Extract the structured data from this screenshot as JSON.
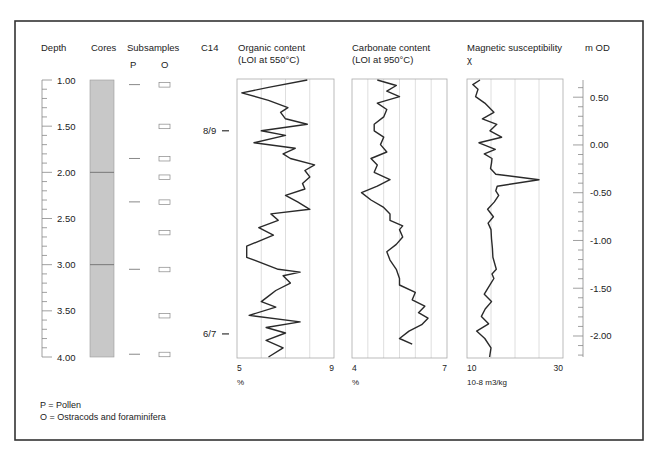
{
  "chart_data": {
    "type": "line",
    "depth_axis": {
      "label": "Depth",
      "ticks": [
        "1.00",
        "1.50",
        "2.00",
        "2.50",
        "3.00",
        "3.50",
        "4.00"
      ],
      "range": [
        1.0,
        4.0
      ]
    },
    "cores": {
      "label": "Cores",
      "top": 1.0,
      "bottom": 4.0,
      "breaks": [
        2.0,
        3.0
      ],
      "fill": "#c8c8c8"
    },
    "subsamples": {
      "label": "Subsamples",
      "columns": [
        "P",
        "O"
      ],
      "P_depths": [
        1.05,
        1.85,
        2.32,
        3.05,
        3.97
      ],
      "O_depths": [
        1.05,
        1.5,
        1.85,
        2.05,
        2.32,
        2.65,
        3.05,
        3.55,
        3.97
      ]
    },
    "c14": {
      "label": "C14",
      "dates": [
        {
          "label": "8/9",
          "depth": 1.55
        },
        {
          "label": "6/7",
          "depth": 3.75
        }
      ]
    },
    "series": [
      {
        "name": "Organic content",
        "subtitle": "(LOI at 550°C)",
        "xmin": 5,
        "xmax": 9,
        "xlabel": "%",
        "tick_labels": [
          "5",
          "9"
        ],
        "grid": [
          6,
          7,
          8
        ],
        "depths": [
          1.0,
          1.08,
          1.14,
          1.22,
          1.3,
          1.35,
          1.42,
          1.48,
          1.55,
          1.6,
          1.68,
          1.74,
          1.8,
          1.85,
          1.92,
          1.98,
          2.05,
          2.12,
          2.18,
          2.25,
          2.32,
          2.4,
          2.45,
          2.52,
          2.6,
          2.68,
          2.8,
          2.92,
          3.05,
          3.08,
          3.12,
          3.2,
          3.28,
          3.34,
          3.4,
          3.46,
          3.55,
          3.62,
          3.68,
          3.74,
          3.82,
          3.9,
          4.0
        ],
        "values": [
          7.9,
          6.3,
          5.2,
          6.3,
          7.1,
          6.8,
          7.0,
          7.9,
          6.0,
          7.0,
          5.7,
          7.4,
          6.9,
          7.2,
          8.2,
          7.8,
          8.0,
          7.7,
          7.8,
          7.0,
          7.5,
          8.0,
          6.4,
          6.7,
          5.9,
          6.5,
          5.4,
          5.4,
          6.7,
          7.6,
          6.9,
          7.2,
          6.6,
          6.3,
          6.0,
          6.6,
          5.5,
          7.6,
          6.2,
          7.0,
          6.2,
          6.9,
          6.3
        ]
      },
      {
        "name": "Carbonate content",
        "subtitle": "(LOI at 950°C)",
        "xmin": 4,
        "xmax": 7,
        "xlabel": "%",
        "tick_labels": [
          "4",
          "7"
        ],
        "grid": [
          4.5,
          5.0,
          5.5,
          6.0,
          6.5
        ],
        "depths": [
          1.0,
          1.06,
          1.12,
          1.18,
          1.25,
          1.32,
          1.4,
          1.48,
          1.55,
          1.62,
          1.7,
          1.78,
          1.85,
          1.92,
          2.0,
          2.08,
          2.15,
          2.22,
          2.3,
          2.38,
          2.45,
          2.52,
          2.58,
          2.62,
          2.7,
          2.78,
          2.86,
          2.95,
          3.05,
          3.15,
          3.22,
          3.3,
          3.38,
          3.45,
          3.52,
          3.58,
          3.65,
          3.72,
          3.8,
          3.86
        ],
        "values": [
          4.8,
          5.4,
          5.1,
          5.5,
          4.8,
          5.1,
          5.0,
          4.7,
          4.7,
          5.0,
          4.9,
          5.1,
          4.6,
          4.8,
          4.7,
          5.2,
          4.8,
          4.3,
          4.6,
          5.0,
          5.2,
          5.2,
          5.6,
          5.5,
          5.6,
          5.4,
          5.1,
          5.2,
          5.4,
          5.5,
          5.5,
          6.0,
          5.9,
          6.3,
          6.1,
          6.4,
          6.2,
          5.8,
          5.5,
          5.9
        ]
      },
      {
        "name": "Magnetic susceptibility",
        "subtitle": "χ",
        "xmin": 10,
        "xmax": 30,
        "xlabel": "10-8 m3/kg",
        "tick_labels": [
          "10",
          "30"
        ],
        "grid": [
          15,
          20,
          25
        ],
        "depths": [
          1.0,
          1.05,
          1.1,
          1.18,
          1.25,
          1.35,
          1.42,
          1.48,
          1.55,
          1.62,
          1.68,
          1.75,
          1.8,
          1.85,
          1.9,
          1.96,
          2.02,
          2.08,
          2.15,
          2.2,
          2.25,
          2.32,
          2.4,
          2.48,
          2.55,
          2.62,
          2.72,
          2.82,
          2.92,
          3.05,
          3.1,
          3.15,
          3.2,
          3.25,
          3.32,
          3.4,
          3.48,
          3.56,
          3.64,
          3.72,
          3.8,
          3.9,
          4.0
        ],
        "values": [
          12.7,
          11.2,
          12.3,
          11.8,
          13.7,
          15.6,
          13.2,
          16.2,
          14.8,
          17.2,
          12.5,
          15.9,
          13.6,
          15.2,
          15.1,
          14.9,
          16.0,
          25.0,
          16.3,
          16.0,
          16.6,
          15.7,
          14.3,
          15.5,
          14.4,
          15.0,
          15.1,
          15.3,
          15.4,
          16.1,
          15.2,
          15.6,
          15.0,
          14.4,
          13.6,
          15.1,
          13.8,
          13.0,
          14.5,
          12.0,
          13.7,
          15.0,
          14.7
        ]
      }
    ],
    "od_axis": {
      "label": "m OD",
      "ticks": [
        "0.50",
        "0.00",
        "-0.50",
        "-1.00",
        "-1.50",
        "-2.00"
      ],
      "range_top": 0.68,
      "range_bottom": -2.22
    },
    "legend": [
      "P = Pollen",
      "O = Ostracods and foraminifera"
    ],
    "grid": true
  },
  "headers": {
    "depth": "Depth",
    "cores": "Cores",
    "subsamples": "Subsamples",
    "p": "P",
    "o": "O",
    "c14": "C14",
    "organic_1": "Organic content",
    "organic_2": "(LOI at 550°C)",
    "carbonate_1": "Carbonate content",
    "carbonate_2": "(LOI at 950°C)",
    "mag_1": "Magnetic susceptibility",
    "mag_2": "χ",
    "od": "m OD"
  },
  "colors": {
    "frame": "#333333",
    "curve": "#2a2a2a",
    "grid": "#d6d6d6",
    "panel": "#aaaaaa",
    "core_fill": "#c8c8c8",
    "text": "#222222"
  }
}
